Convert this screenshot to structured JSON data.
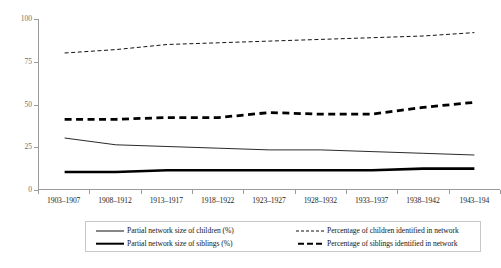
{
  "chart_data": {
    "type": "line",
    "title": "",
    "subtitle": "",
    "xlabel": "",
    "ylabel": "",
    "ylim": [
      0,
      100
    ],
    "yticks": [
      0,
      25,
      50,
      75,
      100
    ],
    "grid": false,
    "legend_position": "bottom",
    "categories": [
      "1903–1907",
      "1908–1912",
      "1913–1917",
      "1918–1922",
      "1923–1927",
      "1928–1932",
      "1933–1937",
      "1938–1942",
      "1943–194"
    ],
    "series": [
      {
        "name": "Partial network size of children (%)",
        "style": "solid-thin",
        "color": "#111111",
        "values": [
          30,
          26,
          25,
          24,
          23,
          23,
          22,
          21,
          20
        ]
      },
      {
        "name": "Partial network size of siblings (%)",
        "style": "solid-thick",
        "color": "#000000",
        "values": [
          10,
          10,
          11,
          11,
          11,
          11,
          11,
          12,
          12
        ]
      },
      {
        "name": "Percentage of children identified in network",
        "style": "dashed-fine",
        "color": "#111111",
        "values": [
          80,
          82,
          85,
          86,
          87,
          88,
          89,
          90,
          92
        ]
      },
      {
        "name": "Percentage of siblings identified in network",
        "style": "dashed-bold",
        "color": "#000000",
        "values": [
          41,
          41,
          42,
          42,
          45,
          44,
          44,
          48,
          51
        ]
      }
    ]
  },
  "axes": {
    "y_tick_labels": [
      "100",
      "75",
      "50",
      "25",
      "0"
    ]
  },
  "legend": {
    "entries": [
      {
        "label": "Partial network size of children (%)",
        "style": "solid-thin"
      },
      {
        "label": "Partial network size of siblings (%)",
        "style": "solid-thick"
      },
      {
        "label": "Percentage of children identified in network",
        "style": "dashed-fine"
      },
      {
        "label": "Percentage of siblings identified in network",
        "style": "dashed-bold"
      }
    ]
  },
  "colors": {
    "axis": "#9a9a9a",
    "tick_text": "#6f6f6f",
    "label_text": "#1e1e1e",
    "series_primary": "#000000"
  }
}
